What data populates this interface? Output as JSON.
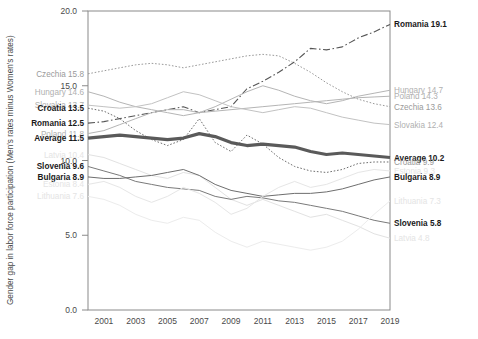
{
  "chart_data": {
    "type": "line",
    "title": "",
    "xlabel": "",
    "ylabel": "Gender gap in labor force participation (Men's rates minus Women's rates)",
    "xlim": [
      2000,
      2019
    ],
    "ylim": [
      0.0,
      20.0
    ],
    "yticks": [
      "0.0",
      "5.0",
      "10.0",
      "15.0",
      "20.0"
    ],
    "ytick_values": [
      0.0,
      5.0,
      10.0,
      15.0,
      20.0
    ],
    "xticks": [
      "2001",
      "2003",
      "2005",
      "2007",
      "2009",
      "2011",
      "2013",
      "2015",
      "2017",
      "2019"
    ],
    "xtick_values": [
      2001,
      2003,
      2005,
      2007,
      2009,
      2011,
      2013,
      2015,
      2017,
      2019
    ],
    "grid": false,
    "legend": "end-labels",
    "x": [
      2000,
      2001,
      2002,
      2003,
      2004,
      2005,
      2006,
      2007,
      2008,
      2009,
      2010,
      2011,
      2012,
      2013,
      2014,
      2015,
      2016,
      2017,
      2018,
      2019
    ],
    "series": [
      {
        "name": "Romania",
        "start_value": 12.5,
        "end_value": 19.1,
        "start_label": "Romania 12.5",
        "end_label": "Romania 19.1",
        "style": "dashdot",
        "color": "#555555",
        "width": 1.1,
        "emphasis": "dark",
        "values": [
          12.5,
          12.6,
          12.8,
          13.0,
          13.2,
          13.4,
          13.6,
          13.2,
          13.4,
          13.6,
          14.8,
          15.3,
          15.9,
          16.6,
          17.5,
          17.4,
          17.6,
          18.2,
          18.6,
          19.1
        ]
      },
      {
        "name": "Hungary",
        "start_value": 14.6,
        "end_value": 14.7,
        "start_label": "Hungary 14.6",
        "end_label": "Hungary 14.7",
        "style": "solid",
        "color": "#b5b5b5",
        "width": 1.0,
        "emphasis": "faded",
        "values": [
          14.6,
          14.3,
          13.9,
          13.6,
          13.4,
          13.2,
          13.0,
          13.2,
          13.6,
          14.1,
          14.6,
          15.0,
          14.7,
          14.3,
          14.0,
          13.8,
          14.0,
          14.3,
          14.5,
          14.7
        ]
      },
      {
        "name": "Poland",
        "start_value": 11.8,
        "end_value": 14.3,
        "start_label": "Poland 11.8",
        "end_label": "Poland 14.3",
        "style": "solid",
        "color": "#b5b5b5",
        "width": 1.0,
        "emphasis": "faded",
        "values": [
          11.8,
          12.0,
          12.4,
          12.8,
          13.2,
          13.4,
          13.4,
          13.2,
          13.3,
          13.4,
          13.5,
          13.6,
          13.7,
          13.8,
          13.9,
          14.0,
          14.1,
          14.2,
          14.25,
          14.3
        ]
      },
      {
        "name": "Czechia",
        "start_value": 15.8,
        "end_value": 13.6,
        "start_label": "Czechia 15.8",
        "end_label": "Czechia 13.6",
        "style": "dotted",
        "color": "#9a9a9a",
        "width": 1.0,
        "emphasis": "mid",
        "values": [
          15.8,
          16.0,
          16.2,
          16.4,
          16.5,
          16.4,
          16.2,
          16.4,
          16.6,
          16.8,
          17.0,
          17.1,
          17.0,
          16.5,
          15.9,
          15.2,
          14.6,
          14.1,
          13.8,
          13.6
        ]
      },
      {
        "name": "Slovakia",
        "start_value": 13.7,
        "end_value": 12.4,
        "start_label": "Slovakia 13.7",
        "end_label": "Slovakia 12.4",
        "style": "solid",
        "color": "#c2c2c2",
        "width": 1.0,
        "emphasis": "faded",
        "values": [
          13.7,
          13.6,
          13.5,
          13.6,
          13.8,
          14.2,
          14.6,
          14.4,
          14.0,
          13.6,
          13.4,
          13.2,
          13.4,
          13.6,
          13.5,
          13.2,
          12.9,
          12.7,
          12.5,
          12.4
        ]
      },
      {
        "name": "Croatia",
        "start_value": 13.5,
        "end_value": 9.9,
        "start_label": "Croatia 13.5",
        "end_label": "Croatia 9.9",
        "style": "dotted",
        "color": "#6e6e6e",
        "width": 1.0,
        "emphasis": "dark",
        "values": [
          13.5,
          13.3,
          12.8,
          12.0,
          11.4,
          11.0,
          11.4,
          12.8,
          11.2,
          10.6,
          11.7,
          11.1,
          10.2,
          9.6,
          9.3,
          9.2,
          9.4,
          9.8,
          9.9,
          9.9
        ]
      },
      {
        "name": "Average",
        "start_value": 11.5,
        "end_value": 10.2,
        "start_label": "Average 11.5",
        "end_label": "Average 10.2",
        "style": "solid",
        "color": "#5a5a5a",
        "width": 3.2,
        "emphasis": "bold",
        "values": [
          11.5,
          11.6,
          11.7,
          11.6,
          11.5,
          11.4,
          11.5,
          11.8,
          11.6,
          11.2,
          11.0,
          11.1,
          11.0,
          10.9,
          10.6,
          10.4,
          10.5,
          10.4,
          10.3,
          10.2
        ]
      },
      {
        "name": "Latvia",
        "start_value": 10.4,
        "end_value": 4.8,
        "start_label": "Latvia 10.4",
        "end_label": "Latvia 4.8",
        "style": "solid",
        "color": "#e2e2e2",
        "width": 1.0,
        "emphasis": "very-faded",
        "values": [
          10.4,
          10.2,
          9.8,
          9.4,
          9.0,
          8.8,
          9.2,
          9.0,
          8.2,
          7.4,
          7.0,
          7.4,
          7.0,
          6.6,
          6.2,
          6.4,
          6.0,
          5.6,
          5.1,
          4.8
        ]
      },
      {
        "name": "Slovenia",
        "start_value": 9.6,
        "end_value": 5.8,
        "start_label": "Slovenia 9.6",
        "end_label": "Slovenia 5.8",
        "style": "solid",
        "color": "#7a7a7a",
        "width": 1.0,
        "emphasis": "dark",
        "values": [
          9.6,
          9.3,
          9.0,
          8.6,
          8.4,
          8.2,
          8.1,
          8.0,
          7.6,
          7.4,
          7.6,
          7.5,
          7.3,
          7.2,
          7.0,
          6.8,
          6.6,
          6.3,
          6.0,
          5.8
        ]
      },
      {
        "name": "Bulgaria",
        "start_value": 8.9,
        "end_value": 8.9,
        "start_label": "Bulgaria 8.9",
        "end_label": "Bulgaria 8.9",
        "style": "solid",
        "color": "#6e6e6e",
        "width": 1.0,
        "emphasis": "dark",
        "values": [
          8.9,
          8.8,
          8.8,
          8.9,
          9.0,
          9.2,
          9.4,
          9.0,
          8.4,
          8.0,
          7.8,
          7.6,
          7.7,
          7.8,
          7.8,
          7.9,
          8.1,
          8.4,
          8.7,
          8.9
        ]
      },
      {
        "name": "Estonia",
        "start_value": 8.4,
        "end_value": 9.3,
        "start_label": "Estonia 8.4",
        "end_label": "Estonia 9.3",
        "style": "solid",
        "color": "#e6e6e6",
        "width": 1.0,
        "emphasis": "very-faded",
        "values": [
          8.4,
          8.6,
          8.2,
          7.6,
          7.2,
          7.6,
          8.2,
          7.8,
          7.2,
          6.4,
          6.8,
          7.6,
          8.2,
          8.6,
          8.2,
          8.4,
          8.8,
          9.2,
          9.4,
          9.3
        ]
      },
      {
        "name": "Lithuania",
        "start_value": 7.6,
        "end_value": 7.3,
        "start_label": "Lithuania 7.6",
        "end_label": "Lithuania 7.3",
        "style": "solid",
        "color": "#ececec",
        "width": 1.0,
        "emphasis": "very-faded",
        "values": [
          7.6,
          7.4,
          7.0,
          6.4,
          6.0,
          5.8,
          6.2,
          6.0,
          5.2,
          4.6,
          4.2,
          4.6,
          4.4,
          4.2,
          4.0,
          4.2,
          4.6,
          5.4,
          6.4,
          7.3
        ]
      }
    ],
    "left_labels": [
      {
        "text": "Czechia 15.8",
        "value": 15.8,
        "emphasis": "mid"
      },
      {
        "text": "Hungary 14.6",
        "value": 14.6,
        "emphasis": "faded"
      },
      {
        "text": "Slovakia 13.7",
        "value": 13.7,
        "emphasis": "faded"
      },
      {
        "text": "Croatia 13.5",
        "value": 13.5,
        "emphasis": "bold"
      },
      {
        "text": "Romania 12.5",
        "value": 12.5,
        "emphasis": "bold"
      },
      {
        "text": "Poland 11.8",
        "value": 11.8,
        "emphasis": "faded"
      },
      {
        "text": "Average 11.5",
        "value": 11.5,
        "emphasis": "bold"
      },
      {
        "text": "Latvia 10.4",
        "value": 10.4,
        "emphasis": "very-faded"
      },
      {
        "text": "Slovenia 9.6",
        "value": 9.6,
        "emphasis": "bold"
      },
      {
        "text": "Bulgaria 8.9",
        "value": 8.9,
        "emphasis": "bold"
      },
      {
        "text": "Estonia 8.4",
        "value": 8.4,
        "emphasis": "very-faded"
      },
      {
        "text": "Lithuania 7.6",
        "value": 7.6,
        "emphasis": "very-faded"
      }
    ],
    "right_labels": [
      {
        "text": "Romania 19.1",
        "value": 19.1,
        "emphasis": "bold"
      },
      {
        "text": "Hungary 14.7",
        "value": 14.7,
        "emphasis": "faded"
      },
      {
        "text": "Poland 14.3",
        "value": 14.3,
        "emphasis": "faded"
      },
      {
        "text": "Czechia 13.6",
        "value": 13.6,
        "emphasis": "mid"
      },
      {
        "text": "Slovakia 12.4",
        "value": 12.4,
        "emphasis": "faded"
      },
      {
        "text": "Average 10.2",
        "value": 10.2,
        "emphasis": "bold"
      },
      {
        "text": "Croatia 9.9",
        "value": 9.9,
        "emphasis": "mid"
      },
      {
        "text": "Bulgaria 8.9",
        "value": 8.9,
        "emphasis": "bold"
      },
      {
        "text": "Estonia 9.3",
        "value": 9.3,
        "emphasis": "very-faded"
      },
      {
        "text": "Slovenia 5.8",
        "value": 5.8,
        "emphasis": "bold"
      },
      {
        "text": "Latvia 4.8",
        "value": 4.8,
        "emphasis": "very-faded"
      },
      {
        "text": "Lithuania 7.3",
        "value": 7.3,
        "emphasis": "very-faded"
      }
    ]
  }
}
